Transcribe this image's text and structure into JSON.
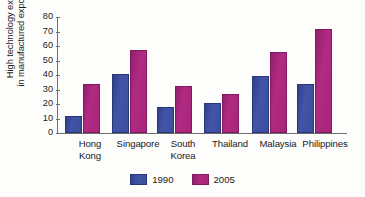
{
  "chart_data": {
    "type": "bar",
    "title": "",
    "xlabel": "",
    "ylabel": "High technology exports\nin manufactured exports (%)",
    "ylabel_line1": "High technology exports",
    "ylabel_line2": "in manufactured exports (%)",
    "ylim": [
      0,
      80
    ],
    "ytick_step": 10,
    "yticks": [
      "0",
      "10",
      "20",
      "30",
      "40",
      "50",
      "60",
      "70",
      "80"
    ],
    "grid": false,
    "legend_position": "bottom-center",
    "categories": [
      "Hong Kong",
      "Singapore",
      "South Korea",
      "Thailand",
      "Malaysia",
      "Philippines"
    ],
    "category_labels": [
      "Hong\nKong",
      "Singapore",
      "South\nKorea",
      "Thailand",
      "Malaysia",
      "Philippines"
    ],
    "series": [
      {
        "name": "1990",
        "color": "#3c4f9e",
        "values": [
          12,
          40.5,
          18,
          21,
          39.5,
          34
        ]
      },
      {
        "name": "2005",
        "color": "#a62579",
        "values": [
          34,
          57,
          32.5,
          27,
          56,
          71.5
        ]
      }
    ]
  },
  "legend": {
    "entries": [
      {
        "label": "1990",
        "color": "#3c4f9e"
      },
      {
        "label": "2005",
        "color": "#a62579"
      }
    ]
  }
}
